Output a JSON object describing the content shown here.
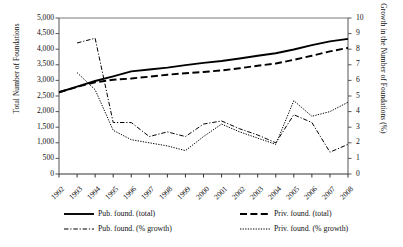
{
  "chart_data": {
    "type": "line",
    "title": "",
    "xlabel": "",
    "ylabel": "Total Number of Foundations",
    "ylabel_secondary": "Growth in the Number of Foundations (%)",
    "categories": [
      1992,
      1993,
      1994,
      1995,
      1996,
      1997,
      1998,
      1999,
      2000,
      2001,
      2002,
      2003,
      2004,
      2005,
      2006,
      2007,
      2008
    ],
    "x_tick_labels": [
      "1992",
      "1993",
      "1994",
      "1995",
      "1996",
      "1997",
      "1998",
      "1999",
      "2000",
      "2001",
      "2002",
      "2003",
      "2004",
      "2005",
      "2006",
      "2007",
      "2008"
    ],
    "ylim": [
      0,
      5000
    ],
    "y_tick_labels": [
      "5,000",
      "4,500",
      "4,000",
      "3,500",
      "3,000",
      "2,500",
      "2,000",
      "1,500",
      "1,000",
      "500",
      "0"
    ],
    "y_ticks": [
      5000,
      4500,
      4000,
      3500,
      3000,
      2500,
      2000,
      1500,
      1000,
      500,
      0
    ],
    "ylim_secondary": [
      0,
      10
    ],
    "y2_tick_labels": [
      "10",
      "9",
      "8",
      "7",
      "6",
      "5",
      "4",
      "3",
      "2",
      "1",
      "0"
    ],
    "y2_ticks": [
      10,
      9,
      8,
      7,
      6,
      5,
      4,
      3,
      2,
      1,
      0
    ],
    "grid": false,
    "legend_position": "bottom",
    "series": [
      {
        "name": "Pub. found. (total)",
        "axis": "left",
        "style": "solid",
        "color": "#000000",
        "values": [
          2620,
          2800,
          2980,
          3130,
          3290,
          3350,
          3410,
          3490,
          3560,
          3620,
          3700,
          3790,
          3870,
          3990,
          4130,
          4250,
          4330
        ]
      },
      {
        "name": "Priv. found. (total)",
        "axis": "left",
        "style": "dashed",
        "color": "#000000",
        "values": [
          2620,
          2790,
          2940,
          3020,
          3060,
          3120,
          3180,
          3230,
          3270,
          3320,
          3390,
          3470,
          3540,
          3660,
          3790,
          3930,
          4040
        ]
      },
      {
        "name": "Pub. found. (% growth)",
        "axis": "right",
        "style": "dash-dot",
        "color": "#000000",
        "values": [
          null,
          8.4,
          8.7,
          3.3,
          3.3,
          2.4,
          2.7,
          2.4,
          3.2,
          3.4,
          2.9,
          2.5,
          2.0,
          3.8,
          3.3,
          1.4,
          1.9
        ]
      },
      {
        "name": "Priv. found. (% growth)",
        "axis": "right",
        "style": "dotted",
        "color": "#000000",
        "values": [
          null,
          6.5,
          5.4,
          2.8,
          2.2,
          2.0,
          1.8,
          1.5,
          2.4,
          3.2,
          2.7,
          2.3,
          1.9,
          4.7,
          3.7,
          4.0,
          4.6
        ]
      }
    ]
  },
  "axes": {
    "left_title": "Total Number of Foundations",
    "right_title": "Growth in the Number of Foundations (%)"
  },
  "legend": {
    "items": [
      {
        "label": "Pub. found. (total)",
        "style": "solid"
      },
      {
        "label": "Priv. found. (total)",
        "style": "dashed"
      },
      {
        "label": "Pub. found. (% growth)",
        "style": "dash-dot"
      },
      {
        "label": "Priv. found. (% growth)",
        "style": "dotted"
      }
    ]
  }
}
